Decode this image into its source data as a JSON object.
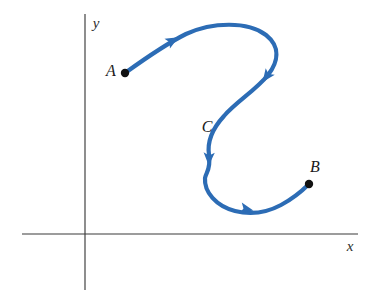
{
  "figure": {
    "background_color": "#ffffff",
    "width": 369,
    "height": 292
  },
  "axes": {
    "axis_color": "#3a3a3a",
    "x_axis": {
      "label": "x",
      "label_x": 350,
      "label_y": 248,
      "x1": 22,
      "y1": 234,
      "x2": 358,
      "y2": 234
    },
    "y_axis": {
      "label": "y",
      "label_x": 96,
      "label_y": 25,
      "x1": 85,
      "y1": 14,
      "x2": 85,
      "y2": 290
    },
    "origin": {
      "x": 85,
      "y": 234
    }
  },
  "curve": {
    "name": "C",
    "color": "#2c6cb5",
    "stroke_width": 4.2,
    "orientation": "from A to B",
    "path": "M 125,73 C 150,55 166,44 186,34 C 212,22 248,21 266,35 C 281,47 278,62 268,75 C 256,90 236,102 224,116 C 213,128 207,142 209,155 C 211,170 206,172 205,178 C 204,192 216,206 235,211 C 251,215 266,213 281,205 C 294,198 302,191 309,184",
    "label": {
      "text": "C",
      "x": 207,
      "y": 128
    },
    "arrows": [
      {
        "name": "arrow-1",
        "x": 172,
        "y": 41,
        "angle": -29
      },
      {
        "name": "arrow-2",
        "x": 267,
        "y": 76,
        "angle": 126
      },
      {
        "name": "arrow-3",
        "x": 209,
        "y": 158,
        "angle": 92
      },
      {
        "name": "arrow-4",
        "x": 246,
        "y": 209,
        "angle": 12
      }
    ]
  },
  "points": [
    {
      "id": "A",
      "label": "A",
      "role": "initial point",
      "dot_x": 125,
      "dot_y": 73,
      "dot_radius": 4.2,
      "color": "#111111",
      "label_x": 111,
      "label_y": 72
    },
    {
      "id": "B",
      "label": "B",
      "role": "terminal point",
      "dot_x": 309,
      "dot_y": 184,
      "dot_radius": 4.2,
      "color": "#111111",
      "label_x": 315,
      "label_y": 168
    }
  ]
}
